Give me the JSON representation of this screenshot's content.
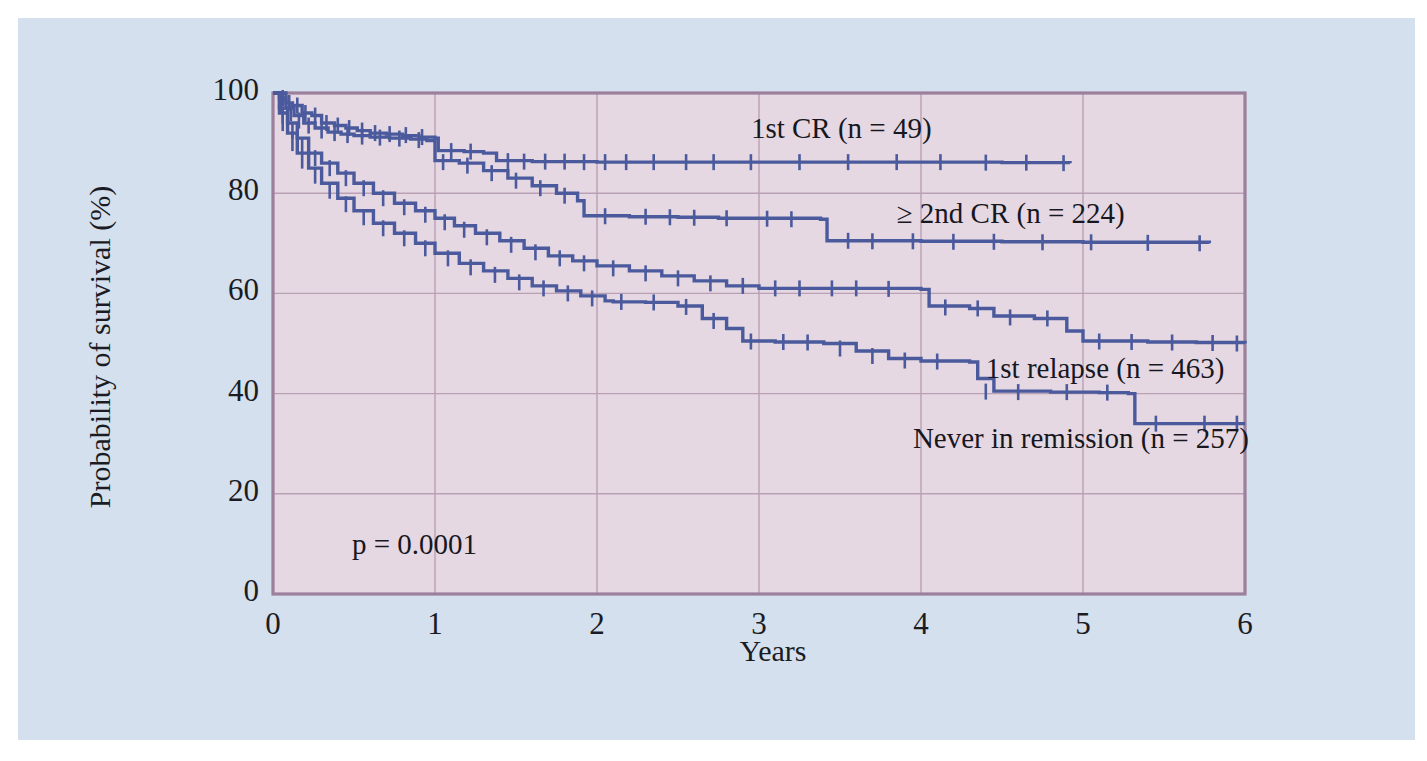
{
  "figure": {
    "background_color": "#d4e0ed",
    "plot_background_color": "#e6d8e2",
    "plot_border_color": "#9b7f9b",
    "gridline_color": "#b9a0b5",
    "curve_color": "#4a5a9c",
    "text_color": "#17171f"
  },
  "chart_data": {
    "type": "line",
    "title": "",
    "subtitle": "",
    "xlabel": "Years",
    "ylabel": "Probability of survival (%)",
    "xlim": [
      0,
      6
    ],
    "ylim": [
      0,
      100
    ],
    "xticks": [
      "0",
      "1",
      "2",
      "3",
      "4",
      "5",
      "6"
    ],
    "xtick_values": [
      0,
      1,
      2,
      3,
      4,
      5,
      6
    ],
    "yticks": [
      "0",
      "20",
      "40",
      "60",
      "80",
      "100"
    ],
    "ytick_values": [
      0,
      20,
      40,
      60,
      80,
      100
    ],
    "grid": true,
    "legend_position": "inline-annotations",
    "annotations": [
      {
        "text": "p = 0.0001",
        "x": 0.45,
        "y": 10
      }
    ],
    "series": [
      {
        "name": "1st CR (n = 49)",
        "n": 49,
        "label_x": 2.95,
        "label_y": 92.5,
        "final_value": 86,
        "end_x": 4.92,
        "points": [
          [
            0.0,
            100
          ],
          [
            0.05,
            100
          ],
          [
            0.08,
            98
          ],
          [
            0.12,
            97.5
          ],
          [
            0.18,
            96
          ],
          [
            0.24,
            95.5
          ],
          [
            0.3,
            94
          ],
          [
            0.38,
            93.5
          ],
          [
            0.45,
            93
          ],
          [
            0.52,
            92.5
          ],
          [
            0.6,
            92
          ],
          [
            0.7,
            91.8
          ],
          [
            0.8,
            91.5
          ],
          [
            0.9,
            91.2
          ],
          [
            1.0,
            91
          ],
          [
            1.02,
            88.5
          ],
          [
            1.18,
            88.3
          ],
          [
            1.3,
            88
          ],
          [
            1.38,
            86.5
          ],
          [
            1.6,
            86.3
          ],
          [
            2.0,
            86.2
          ],
          [
            2.5,
            86.2
          ],
          [
            3.0,
            86.2
          ],
          [
            3.5,
            86.2
          ],
          [
            4.0,
            86.2
          ],
          [
            4.5,
            86.1
          ],
          [
            4.92,
            86.0
          ]
        ],
        "censor_x": [
          0.06,
          0.1,
          0.15,
          0.2,
          0.26,
          0.33,
          0.4,
          0.47,
          0.55,
          0.63,
          0.72,
          0.82,
          0.92,
          1.1,
          1.22,
          1.45,
          1.55,
          1.68,
          1.8,
          1.92,
          2.05,
          2.18,
          2.35,
          2.55,
          2.72,
          2.95,
          3.25,
          3.55,
          3.85,
          4.12,
          4.4,
          4.65,
          4.88
        ],
        "censor_y": [
          99,
          98,
          97.5,
          96,
          95.5,
          94,
          93.5,
          93,
          92.5,
          92,
          91.8,
          91.6,
          91.2,
          88.4,
          88.3,
          86.4,
          86.3,
          86.3,
          86.3,
          86.2,
          86.2,
          86.2,
          86.2,
          86.2,
          86.2,
          86.2,
          86.2,
          86.2,
          86.2,
          86.2,
          86.1,
          86.1,
          86.0
        ]
      },
      {
        "name": "≥ 2nd CR (n = 224)",
        "n": 224,
        "label_x": 3.85,
        "label_y": 75.5,
        "final_value": 70,
        "end_x": 5.78,
        "points": [
          [
            0.0,
            100
          ],
          [
            0.04,
            99
          ],
          [
            0.08,
            97
          ],
          [
            0.13,
            95.5
          ],
          [
            0.19,
            94
          ],
          [
            0.26,
            93
          ],
          [
            0.34,
            92.2
          ],
          [
            0.42,
            91.8
          ],
          [
            0.5,
            91.5
          ],
          [
            0.6,
            91.2
          ],
          [
            0.72,
            91.0
          ],
          [
            0.85,
            90.8
          ],
          [
            0.95,
            90.5
          ],
          [
            1.0,
            86.5
          ],
          [
            1.15,
            86.0
          ],
          [
            1.3,
            84.5
          ],
          [
            1.45,
            83.0
          ],
          [
            1.6,
            81.5
          ],
          [
            1.75,
            80.0
          ],
          [
            1.88,
            78.5
          ],
          [
            1.92,
            75.5
          ],
          [
            2.2,
            75.3
          ],
          [
            2.5,
            75.2
          ],
          [
            2.75,
            75.0
          ],
          [
            2.9,
            75.0
          ],
          [
            3.38,
            74.8
          ],
          [
            3.42,
            70.5
          ],
          [
            4.0,
            70.4
          ],
          [
            4.5,
            70.3
          ],
          [
            5.0,
            70.2
          ],
          [
            5.78,
            70.0
          ]
        ],
        "censor_x": [
          0.05,
          0.11,
          0.16,
          0.22,
          0.3,
          0.38,
          0.46,
          0.55,
          0.66,
          0.78,
          0.9,
          1.05,
          1.2,
          1.35,
          1.5,
          1.65,
          1.8,
          2.05,
          2.3,
          2.45,
          2.6,
          2.8,
          3.05,
          3.2,
          3.55,
          3.7,
          3.95,
          4.2,
          4.45,
          4.75,
          5.05,
          5.4,
          5.72
        ],
        "censor_y": [
          98,
          96,
          94.5,
          93.5,
          92.5,
          92,
          91.6,
          91.3,
          91.1,
          90.9,
          90.6,
          86.2,
          85.5,
          84.0,
          82.5,
          81.0,
          79.5,
          75.4,
          75.3,
          75.2,
          75.1,
          75.0,
          74.9,
          74.8,
          70.5,
          70.4,
          70.4,
          70.3,
          70.3,
          70.2,
          70.2,
          70.1,
          70.0
        ]
      },
      {
        "name": "1st relapse (n = 463)",
        "n": 463,
        "label_x": 4.4,
        "label_y": 44.5,
        "final_value": 50,
        "end_x": 6.0,
        "points": [
          [
            0.0,
            100
          ],
          [
            0.04,
            97
          ],
          [
            0.09,
            94
          ],
          [
            0.15,
            91
          ],
          [
            0.22,
            88
          ],
          [
            0.3,
            86
          ],
          [
            0.4,
            84
          ],
          [
            0.5,
            82
          ],
          [
            0.62,
            80
          ],
          [
            0.75,
            78
          ],
          [
            0.88,
            76.5
          ],
          [
            1.0,
            75
          ],
          [
            1.12,
            73.5
          ],
          [
            1.25,
            72
          ],
          [
            1.4,
            70.5
          ],
          [
            1.55,
            69
          ],
          [
            1.7,
            67.5
          ],
          [
            1.85,
            66.5
          ],
          [
            2.0,
            65.5
          ],
          [
            2.2,
            64.5
          ],
          [
            2.4,
            63.5
          ],
          [
            2.6,
            62.5
          ],
          [
            2.8,
            61.5
          ],
          [
            3.0,
            61.0
          ],
          [
            3.4,
            61.0
          ],
          [
            3.7,
            61.0
          ],
          [
            4.0,
            60.8
          ],
          [
            4.05,
            57.5
          ],
          [
            4.3,
            57.0
          ],
          [
            4.45,
            55.5
          ],
          [
            4.7,
            55.0
          ],
          [
            4.9,
            52.5
          ],
          [
            5.0,
            50.5
          ],
          [
            5.4,
            50.3
          ],
          [
            5.7,
            50.2
          ],
          [
            6.0,
            50.0
          ]
        ],
        "censor_x": [
          0.06,
          0.12,
          0.18,
          0.26,
          0.35,
          0.45,
          0.56,
          0.68,
          0.81,
          0.94,
          1.06,
          1.18,
          1.32,
          1.47,
          1.62,
          1.77,
          1.92,
          2.1,
          2.3,
          2.5,
          2.7,
          2.9,
          3.1,
          3.25,
          3.45,
          3.6,
          3.8,
          4.15,
          4.35,
          4.55,
          4.78,
          5.1,
          5.3,
          5.55,
          5.8,
          5.95
        ],
        "censor_y": [
          95.5,
          92.5,
          89.5,
          87,
          85,
          83,
          81,
          79,
          77.2,
          75.7,
          74.2,
          72.7,
          71.2,
          69.7,
          68.2,
          67,
          66,
          65,
          64,
          63,
          62,
          61.5,
          61,
          61,
          61,
          61,
          60.9,
          57.2,
          57,
          55.2,
          55,
          50.4,
          50.3,
          50.2,
          50.1,
          50.0
        ]
      },
      {
        "name": "Never in remission (n = 257)",
        "n": 257,
        "label_x": 3.95,
        "label_y": 30.5,
        "final_value": 34,
        "end_x": 6.0,
        "points": [
          [
            0.0,
            100
          ],
          [
            0.04,
            96
          ],
          [
            0.09,
            92
          ],
          [
            0.15,
            88
          ],
          [
            0.22,
            85
          ],
          [
            0.3,
            82
          ],
          [
            0.4,
            79
          ],
          [
            0.5,
            76.5
          ],
          [
            0.62,
            74
          ],
          [
            0.75,
            72
          ],
          [
            0.88,
            70
          ],
          [
            1.0,
            68
          ],
          [
            1.15,
            66
          ],
          [
            1.3,
            64.5
          ],
          [
            1.45,
            63
          ],
          [
            1.6,
            61.5
          ],
          [
            1.75,
            60.5
          ],
          [
            1.9,
            59.5
          ],
          [
            2.05,
            58.5
          ],
          [
            2.1,
            58.3
          ],
          [
            2.3,
            58.2
          ],
          [
            2.5,
            57.5
          ],
          [
            2.65,
            55.0
          ],
          [
            2.8,
            53.0
          ],
          [
            2.9,
            50.5
          ],
          [
            3.1,
            50.3
          ],
          [
            3.4,
            50.0
          ],
          [
            3.6,
            48.5
          ],
          [
            3.8,
            47.0
          ],
          [
            4.0,
            46.5
          ],
          [
            4.3,
            46.3
          ],
          [
            4.35,
            43.0
          ],
          [
            4.45,
            40.5
          ],
          [
            4.8,
            40.3
          ],
          [
            5.1,
            40.2
          ],
          [
            5.28,
            40.0
          ],
          [
            5.32,
            34.0
          ],
          [
            5.7,
            34.0
          ],
          [
            6.0,
            34.0
          ]
        ],
        "censor_x": [
          0.06,
          0.12,
          0.18,
          0.26,
          0.35,
          0.45,
          0.56,
          0.68,
          0.81,
          0.94,
          1.08,
          1.22,
          1.37,
          1.52,
          1.67,
          1.82,
          1.97,
          2.15,
          2.35,
          2.55,
          2.72,
          2.95,
          3.15,
          3.3,
          3.5,
          3.7,
          3.9,
          4.1,
          4.4,
          4.6,
          4.9,
          5.15,
          5.45,
          5.75,
          5.95
        ],
        "censor_y": [
          94,
          90,
          86.5,
          83.5,
          80.5,
          77.8,
          75.2,
          73,
          71,
          69,
          67,
          65.2,
          63.7,
          62.2,
          61,
          60,
          59,
          58.3,
          58.2,
          57.3,
          54.5,
          50.4,
          50.3,
          50.2,
          49,
          47.5,
          46.6,
          46.4,
          40.4,
          40.3,
          40.3,
          40.2,
          34.0,
          34.0,
          34.0
        ]
      }
    ]
  }
}
